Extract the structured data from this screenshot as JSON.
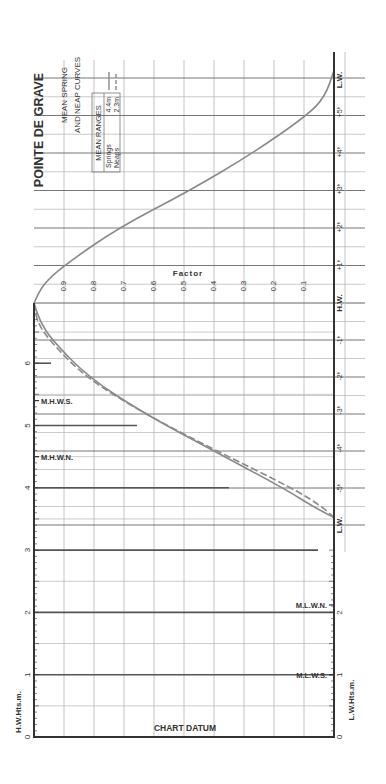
{
  "chart_data": {
    "type": "line",
    "title": "POINTE DE GRAVE",
    "subtitle": [
      "MEAN SPRING",
      "AND NEAP CURVES"
    ],
    "orientation": "rotated 90 degrees counter-clockwise (read with page turned)",
    "legend": {
      "header": "MEAN RANGES",
      "entries": [
        {
          "name": "Springs",
          "range": "4.4m",
          "style": "solid"
        },
        {
          "name": "Neaps",
          "range": "2.3m",
          "style": "dashed"
        }
      ]
    },
    "factor_axis": {
      "label": "Factor",
      "ticks": [
        "0.9",
        "0.8",
        "0.7",
        "0.6",
        "0.5",
        "0.4",
        "0.3",
        "0.2",
        "0.1"
      ],
      "range": [
        0,
        1
      ]
    },
    "time_axis": {
      "labels_rising": [
        "L.W.",
        "-5h",
        "-4h",
        "-3h",
        "-2h",
        "-1h",
        "H.W."
      ],
      "labels_falling": [
        "H.W.",
        "+1h",
        "+2h",
        "+3h",
        "+4h",
        "+5h",
        "L.W."
      ],
      "tick_labels": [
        "L.W.",
        "+5ʰ",
        "+4ʰ",
        "+3ʰ",
        "+2ʰ",
        "+1ʰ",
        "H.W.",
        "-1ʰ",
        "-2ʰ",
        "-3ʰ",
        "-4ʰ",
        "-5ʰ",
        "L.W."
      ]
    },
    "height_axes": {
      "hw_label": "H.W.Hts.m.",
      "lw_label": "L.W.Hts.m.",
      "hw_ticks": [
        "0",
        "1",
        "2",
        "3",
        "4",
        "5",
        "6"
      ],
      "lw_ticks": [
        "0",
        "1",
        "2"
      ],
      "datum_label": "CHART DATUM",
      "levels": [
        {
          "name": "M.H.W.S.",
          "height": 5.4
        },
        {
          "name": "M.H.W.N.",
          "height": 4.5
        },
        {
          "name": "M.L.W.N.",
          "height": 2.1
        },
        {
          "name": "M.L.W.S.",
          "height": 1.0
        }
      ]
    },
    "series": [
      {
        "name": "Springs (rising)",
        "style": "solid",
        "x_hours": [
          -5.8,
          -5.5,
          -5,
          -4,
          -3,
          -2,
          -1,
          -0.5,
          0
        ],
        "factor": [
          0.0,
          0.07,
          0.17,
          0.4,
          0.63,
          0.82,
          0.94,
          0.98,
          1.0
        ]
      },
      {
        "name": "Neaps (rising)",
        "style": "dashed",
        "x_hours": [
          -5.8,
          -5.5,
          -5,
          -4,
          -3,
          -2,
          -1,
          -0.5,
          0
        ],
        "factor": [
          0.0,
          0.04,
          0.14,
          0.39,
          0.63,
          0.83,
          0.95,
          0.99,
          1.0
        ]
      },
      {
        "name": "Springs/Neaps (falling)",
        "style": "solid",
        "x_hours": [
          0,
          0.5,
          1,
          2,
          3,
          4,
          5,
          5.5,
          6.2
        ],
        "factor": [
          1.0,
          0.97,
          0.9,
          0.72,
          0.48,
          0.27,
          0.09,
          0.03,
          0.0
        ]
      }
    ],
    "grid": true
  },
  "colors": {
    "axis": "#333333",
    "grid": "#b5b5b5",
    "grid_strong": "#666666",
    "curve": "#8a8a8a",
    "text": "#333333"
  }
}
